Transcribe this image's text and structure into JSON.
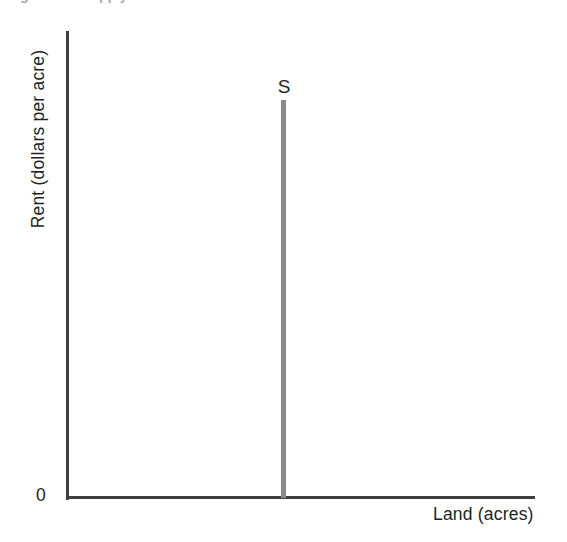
{
  "figure": {
    "caption": "Figure   The Supply of Land",
    "background_color": "#ffffff",
    "axis_color": "#3f3f41",
    "curve_color": "#8a8a8c",
    "text_color": "#231f20"
  },
  "chart_data": {
    "type": "line",
    "title": "The Supply of Land",
    "xlabel": "Land (acres)",
    "ylabel": "Rent (dollars per acre)",
    "origin_label": "0",
    "grid": false,
    "legend": "none",
    "xlim": [
      0,
      100
    ],
    "ylim": [
      0,
      100
    ],
    "xticks": [],
    "yticks": [],
    "annotations": [
      {
        "text": "S",
        "x": 46,
        "y": 89,
        "describes": "supply-curve-label"
      }
    ],
    "series": [
      {
        "name": "S",
        "label": "S",
        "description": "Perfectly inelastic supply of land: a vertical line at a fixed quantity of acres.",
        "color": "#8a8a8c",
        "x": [
          46,
          46
        ],
        "y": [
          0,
          85
        ]
      }
    ]
  }
}
